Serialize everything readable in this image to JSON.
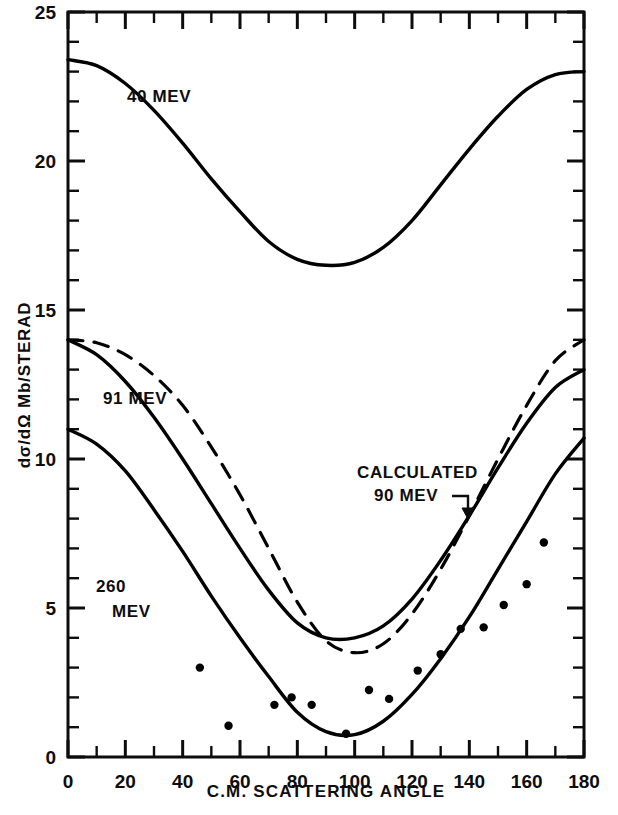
{
  "chart_data": {
    "type": "line",
    "title": "",
    "xlabel": "C.M. SCATTERING ANGLE",
    "ylabel": "dσ/dΩ  Mb/STERAD",
    "xlim": [
      0,
      180
    ],
    "ylim": [
      0,
      25
    ],
    "grid": false,
    "legend_position": "inline-annotations",
    "xticks": [
      0,
      20,
      40,
      60,
      80,
      100,
      120,
      140,
      160,
      180
    ],
    "xtick_labels": [
      "0",
      "20",
      "40",
      "60",
      "80",
      "100",
      "120",
      "140",
      "160",
      "180"
    ],
    "x_minor_tick_step": 10,
    "yticks": [
      0,
      5,
      10,
      15,
      20,
      25
    ],
    "ytick_labels": [
      "0",
      "5",
      "10",
      "15",
      "20",
      "25"
    ],
    "y_minor_tick_step": 1,
    "series": [
      {
        "name": "40 MEV",
        "style": "solid",
        "color": "#000000",
        "label": "40 MEV",
        "label_x": 22,
        "label_y": 21.9,
        "x": [
          0,
          10,
          20,
          30,
          40,
          50,
          60,
          70,
          80,
          90,
          100,
          110,
          120,
          130,
          140,
          150,
          160,
          170,
          180
        ],
        "y": [
          23.4,
          23.2,
          22.6,
          21.7,
          20.6,
          19.4,
          18.3,
          17.3,
          16.7,
          16.5,
          16.6,
          17.1,
          18.0,
          19.2,
          20.4,
          21.5,
          22.4,
          22.9,
          23.0
        ]
      },
      {
        "name": "91 MEV",
        "style": "solid",
        "color": "#000000",
        "label": "91 MEV",
        "label_x": 12,
        "label_y": 12.4,
        "x": [
          0,
          10,
          20,
          30,
          40,
          50,
          60,
          70,
          80,
          90,
          100,
          110,
          120,
          130,
          140,
          150,
          160,
          170,
          180
        ],
        "y": [
          14.0,
          13.5,
          12.6,
          11.4,
          10.0,
          8.5,
          7.0,
          5.6,
          4.5,
          4.0,
          4.0,
          4.4,
          5.3,
          6.6,
          8.1,
          9.7,
          11.2,
          12.4,
          13.0
        ]
      },
      {
        "name": "260 MEV",
        "style": "solid",
        "color": "#000000",
        "label": "260 MEV",
        "label_x": 13,
        "label_y": 6.3,
        "x": [
          0,
          10,
          20,
          30,
          40,
          50,
          60,
          70,
          80,
          90,
          100,
          110,
          120,
          130,
          140,
          150,
          160,
          170,
          180
        ],
        "y": [
          11.0,
          10.5,
          9.6,
          8.3,
          6.9,
          5.4,
          4.0,
          2.7,
          1.5,
          0.85,
          0.75,
          1.2,
          2.1,
          3.3,
          4.7,
          6.3,
          7.9,
          9.5,
          10.7
        ]
      },
      {
        "name": "CALCULATED 90 MEV",
        "style": "dashed",
        "color": "#000000",
        "label": "CALCULATED\n90 MEV",
        "label_line1": "CALCULATED",
        "label_line2": "90 MEV",
        "label_x": 101,
        "label_y": 10.4,
        "x": [
          0,
          10,
          20,
          30,
          40,
          50,
          60,
          70,
          80,
          90,
          100,
          110,
          120,
          130,
          140,
          150,
          160,
          170,
          180
        ],
        "y": [
          14.0,
          13.9,
          13.5,
          12.8,
          11.8,
          10.4,
          8.8,
          7.0,
          5.2,
          3.9,
          3.5,
          3.8,
          4.8,
          6.3,
          8.1,
          10.0,
          11.8,
          13.3,
          14.0
        ]
      }
    ],
    "scatter_points": {
      "name": "260 MEV experimental points",
      "marker": "filled-circle",
      "color": "#000000",
      "points": [
        {
          "x": 46,
          "y": 3.0
        },
        {
          "x": 56,
          "y": 1.05
        },
        {
          "x": 72,
          "y": 1.75
        },
        {
          "x": 78,
          "y": 2.0
        },
        {
          "x": 85,
          "y": 1.75
        },
        {
          "x": 97,
          "y": 0.78
        },
        {
          "x": 105,
          "y": 2.25
        },
        {
          "x": 112,
          "y": 1.95
        },
        {
          "x": 122,
          "y": 2.9
        },
        {
          "x": 130,
          "y": 3.45
        },
        {
          "x": 137,
          "y": 4.3
        },
        {
          "x": 145,
          "y": 4.35
        },
        {
          "x": 152,
          "y": 5.1
        },
        {
          "x": 160,
          "y": 5.8
        },
        {
          "x": 166,
          "y": 7.2
        }
      ]
    },
    "annotations": [
      {
        "text": "CALCULATED 90 MEV",
        "pointer": "arrow",
        "points_to_x": 112,
        "points_to_y": 8.5
      }
    ]
  },
  "figure": {
    "frame_color": "#0d0d0d",
    "background": "#ffffff"
  }
}
